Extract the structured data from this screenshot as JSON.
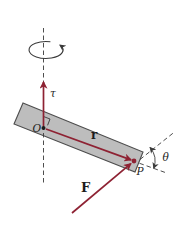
{
  "figure": {
    "type": "physics-diagram",
    "topic": "Torque on a rod: force F applied at point P, position vector r from pivot O, torque vector tau along rotation axis, angle theta between F line and rod extension",
    "labels": {
      "torque": "τ",
      "origin": "O",
      "position_vector": "r",
      "point": "P",
      "force": "F",
      "angle": "θ"
    },
    "colors": {
      "vector": "#8e2233",
      "rod_fill": "#bdbdbd",
      "rod_stroke": "#4d4d4d",
      "line": "#3a3a3a",
      "label": "#1c1c1c",
      "background": "#ffffff"
    }
  }
}
